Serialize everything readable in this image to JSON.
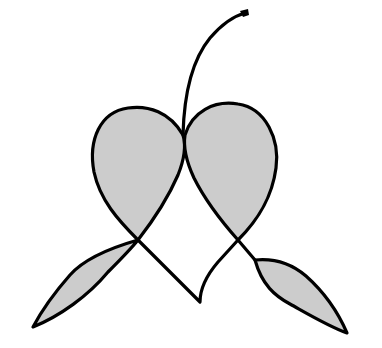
{
  "figure": {
    "colors": {
      "fill": "#cccccc",
      "stroke": "#000000",
      "background": "#ffffff"
    },
    "parts": [
      {
        "name": "stem"
      },
      {
        "name": "left-lobe"
      },
      {
        "name": "right-lobe"
      },
      {
        "name": "left-leaf"
      },
      {
        "name": "right-leaf"
      },
      {
        "name": "center-v"
      }
    ]
  }
}
